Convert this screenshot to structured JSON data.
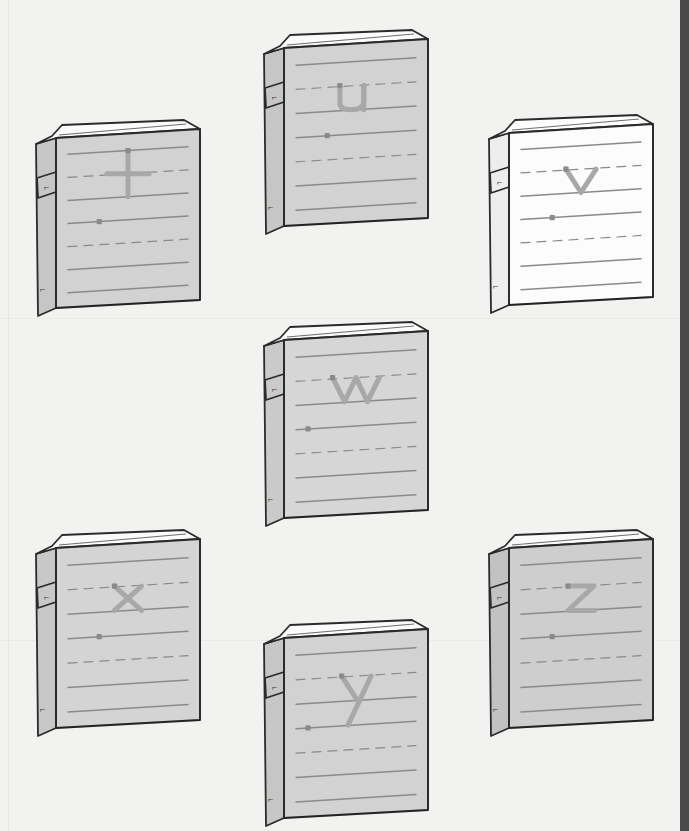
{
  "page": {
    "background_color": "#f2f2f0",
    "right_edge_color": "#4a4a4a",
    "line_color": "#8a8a8a",
    "letter_color": "#a8a8a8",
    "outline_color": "#2b2b2b",
    "dot_color": "#8a8a8a"
  },
  "books": [
    {
      "id": "book-t",
      "letter": "t",
      "cover_color": "#d2d2d2",
      "spine_color": "#c6c6c6",
      "top_color": "#fbfbfb",
      "x": 30,
      "y": 118,
      "w": 170,
      "h": 190,
      "corner_glyph": "⌐",
      "clasp_glyph": "⌐"
    },
    {
      "id": "book-u",
      "letter": "u",
      "cover_color": "#d2d2d2",
      "spine_color": "#c6c6c6",
      "top_color": "#fbfbfb",
      "x": 258,
      "y": 28,
      "w": 170,
      "h": 198,
      "corner_glyph": "⌐",
      "clasp_glyph": "⌐"
    },
    {
      "id": "book-v",
      "letter": "v",
      "cover_color": "#fcfcfc",
      "spine_color": "#ededed",
      "top_color": "#fdfdfd",
      "x": 483,
      "y": 113,
      "w": 170,
      "h": 192,
      "corner_glyph": "⌐",
      "clasp_glyph": "⌐"
    },
    {
      "id": "book-w",
      "letter": "w",
      "cover_color": "#d6d6d6",
      "spine_color": "#cacaca",
      "top_color": "#fbfbfb",
      "x": 258,
      "y": 320,
      "w": 170,
      "h": 198,
      "corner_glyph": "⌐",
      "clasp_glyph": "⌐"
    },
    {
      "id": "book-x",
      "letter": "x",
      "cover_color": "#d4d4d4",
      "spine_color": "#c8c8c8",
      "top_color": "#fbfbfb",
      "x": 30,
      "y": 528,
      "w": 170,
      "h": 200,
      "corner_glyph": "⌐",
      "clasp_glyph": "⌐"
    },
    {
      "id": "book-y",
      "letter": "y",
      "cover_color": "#d2d2d2",
      "spine_color": "#c6c6c6",
      "top_color": "#fbfbfb",
      "x": 258,
      "y": 618,
      "w": 170,
      "h": 200,
      "corner_glyph": "⌐",
      "clasp_glyph": "⌐"
    },
    {
      "id": "book-z",
      "letter": "z",
      "cover_color": "#cecece",
      "spine_color": "#c2c2c2",
      "top_color": "#fbfbfb",
      "x": 483,
      "y": 528,
      "w": 170,
      "h": 200,
      "corner_glyph": "⌐",
      "clasp_glyph": "⌐"
    }
  ],
  "rule_lines": {
    "description": "handwriting guide lines on each cover",
    "pattern": [
      "solid",
      "dashed",
      "solid",
      "solid",
      "dashed",
      "solid",
      "solid"
    ]
  }
}
